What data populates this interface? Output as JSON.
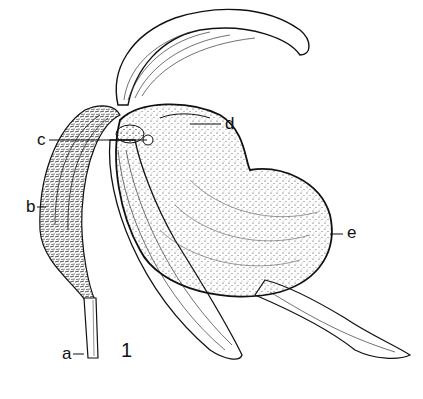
{
  "figure": {
    "number": "1",
    "labels": [
      {
        "id": "a",
        "text": "a",
        "x": 62,
        "y": 345
      },
      {
        "id": "b",
        "text": "b",
        "x": 26,
        "y": 198
      },
      {
        "id": "c",
        "text": "c",
        "x": 37,
        "y": 132
      },
      {
        "id": "d",
        "text": "d",
        "x": 225,
        "y": 117
      },
      {
        "id": "e",
        "text": "e",
        "x": 347,
        "y": 226
      }
    ]
  }
}
